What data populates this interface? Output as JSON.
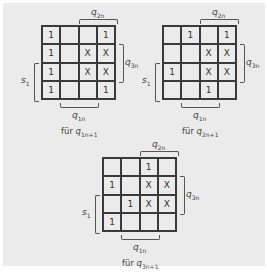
{
  "maps": [
    {
      "id": "q1",
      "caption_prefix": "für",
      "caption_var": "q",
      "caption_sub": "1n+1",
      "labels": {
        "top": "q",
        "top_sub": "2n",
        "right": "q",
        "right_sub": "3n",
        "left": "s",
        "left_sub": "1",
        "bottom": "q",
        "bottom_sub": "1n"
      },
      "cells": [
        [
          "1",
          "",
          "",
          "1"
        ],
        [
          "1",
          "",
          "X",
          "X"
        ],
        [
          "1",
          "",
          "X",
          "X"
        ],
        [
          "1",
          "",
          "",
          "1"
        ]
      ]
    },
    {
      "id": "q2",
      "caption_prefix": "für",
      "caption_var": "q",
      "caption_sub": "2n+1",
      "labels": {
        "top": "q",
        "top_sub": "2n",
        "right": "q",
        "right_sub": "3n",
        "left": "s",
        "left_sub": "1",
        "bottom": "q",
        "bottom_sub": "1n"
      },
      "cells": [
        [
          "",
          "1",
          "",
          "1"
        ],
        [
          "",
          "",
          "X",
          "X"
        ],
        [
          "1",
          "",
          "X",
          "X"
        ],
        [
          "",
          "",
          "1",
          ""
        ]
      ]
    },
    {
      "id": "q3",
      "caption_prefix": "für",
      "caption_var": "q",
      "caption_sub": "3n+1",
      "labels": {
        "top": "q",
        "top_sub": "2n",
        "right": "q",
        "right_sub": "3n",
        "left": "s",
        "left_sub": "1",
        "bottom": "q",
        "bottom_sub": "1n"
      },
      "cells": [
        [
          "",
          "",
          "1",
          ""
        ],
        [
          "1",
          "",
          "X",
          "X"
        ],
        [
          "",
          "1",
          "X",
          "X"
        ],
        [
          "1",
          "",
          "",
          ""
        ]
      ]
    }
  ]
}
